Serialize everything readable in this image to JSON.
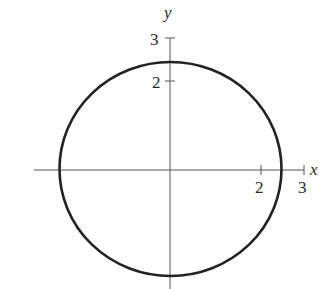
{
  "figure": {
    "type": "circle-graph",
    "axes": {
      "x_label": "x",
      "y_label": "y",
      "x_ticks": [
        {
          "value": 2,
          "label": "2"
        },
        {
          "value": 3,
          "label": "3"
        }
      ],
      "y_ticks": [
        {
          "value": 2,
          "label": "2"
        },
        {
          "value": 3,
          "label": "3"
        }
      ]
    },
    "curve": {
      "shape": "circle",
      "center": [
        0,
        0
      ],
      "approx_radius": 2.5,
      "stroke_color": "#222222"
    },
    "colors": {
      "axis": "#555555",
      "background": "#ffffff"
    }
  }
}
